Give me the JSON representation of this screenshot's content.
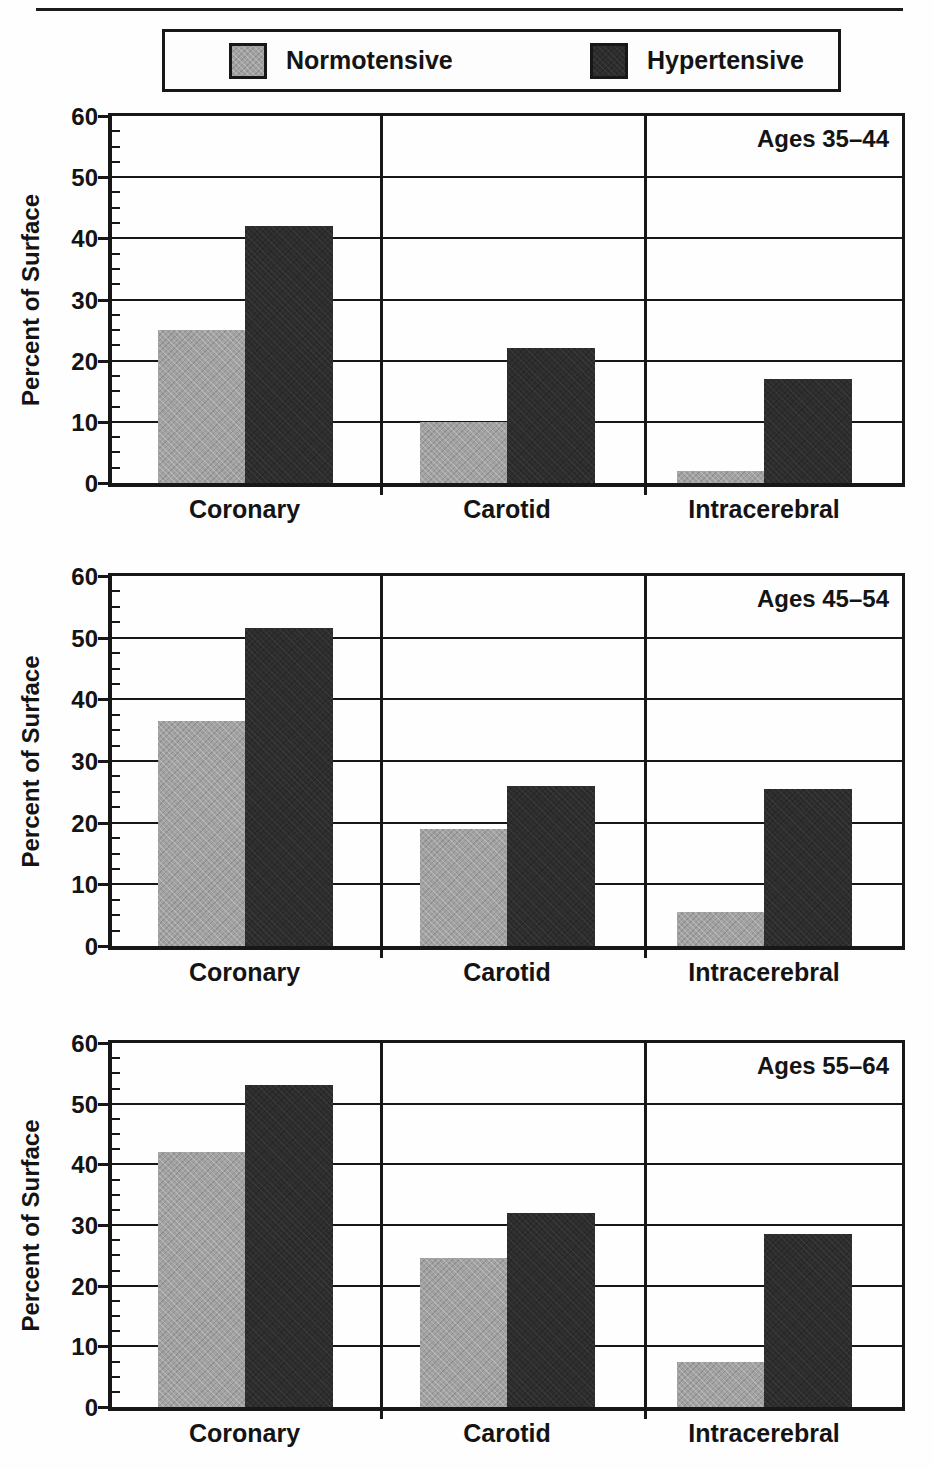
{
  "legend": {
    "normotensive": "Normotensive",
    "hypertensive": "Hypertensive"
  },
  "colors": {
    "normotensive": "#a2a2a2",
    "hypertensive": "#2d2d2d",
    "axis": "#171717",
    "background": "#fefefe"
  },
  "chart_data": [
    {
      "type": "bar",
      "title": "Ages 35–44",
      "ylabel": "Percent of Surface",
      "ylim": [
        0,
        60
      ],
      "yticks": [
        0,
        10,
        20,
        30,
        40,
        50,
        60
      ],
      "grid": true,
      "legend_position": "top",
      "categories": [
        "Coronary",
        "Carotid",
        "Intracerebral"
      ],
      "series": [
        {
          "name": "Normotensive",
          "values": [
            25,
            10,
            2
          ]
        },
        {
          "name": "Hypertensive",
          "values": [
            42,
            22,
            17
          ]
        }
      ]
    },
    {
      "type": "bar",
      "title": "Ages 45–54",
      "ylabel": "Percent of Surface",
      "ylim": [
        0,
        60
      ],
      "yticks": [
        0,
        10,
        20,
        30,
        40,
        50,
        60
      ],
      "grid": true,
      "legend_position": "top",
      "categories": [
        "Coronary",
        "Carotid",
        "Intracerebral"
      ],
      "series": [
        {
          "name": "Normotensive",
          "values": [
            36.5,
            19,
            5.5
          ]
        },
        {
          "name": "Hypertensive",
          "values": [
            51.5,
            26,
            25.5
          ]
        }
      ]
    },
    {
      "type": "bar",
      "title": "Ages 55–64",
      "ylabel": "Percent of Surface",
      "ylim": [
        0,
        60
      ],
      "yticks": [
        0,
        10,
        20,
        30,
        40,
        50,
        60
      ],
      "grid": true,
      "legend_position": "top",
      "categories": [
        "Coronary",
        "Carotid",
        "Intracerebral"
      ],
      "series": [
        {
          "name": "Normotensive",
          "values": [
            42,
            24.5,
            7.5
          ]
        },
        {
          "name": "Hypertensive",
          "values": [
            53,
            32,
            28.5
          ]
        }
      ]
    }
  ]
}
